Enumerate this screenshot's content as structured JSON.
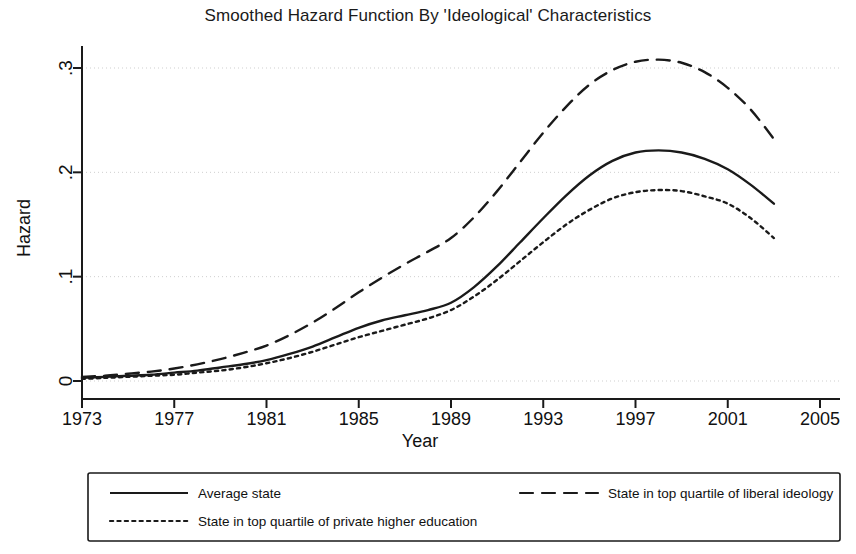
{
  "chart_data": {
    "type": "line",
    "title": "Smoothed Hazard Function By 'Ideological' Characteristics",
    "xlabel": "Year",
    "ylabel": "Hazard",
    "xlim": [
      1973,
      2005
    ],
    "ylim": [
      0,
      0.33
    ],
    "xticks": [
      1973,
      1977,
      1981,
      1985,
      1989,
      1993,
      1997,
      2001,
      2005
    ],
    "xtick_labels": [
      "1973",
      "1977",
      "1981",
      "1985",
      "1989",
      "1993",
      "1997",
      "2001",
      "2005"
    ],
    "yticks": [
      0,
      0.1,
      0.2,
      0.3
    ],
    "ytick_labels": [
      "0",
      ".1",
      ".2",
      ".3"
    ],
    "grid": "horizontal-dotted-light",
    "legend_position": "below-plot",
    "x": [
      1973,
      1974,
      1975,
      1976,
      1977,
      1978,
      1979,
      1980,
      1981,
      1982,
      1983,
      1984,
      1985,
      1986,
      1987,
      1988,
      1989,
      1990,
      1991,
      1992,
      1993,
      1994,
      1995,
      1996,
      1997,
      1998,
      1999,
      2000,
      2001,
      2002,
      2003
    ],
    "series": [
      {
        "name": "Average state",
        "style": "solid",
        "values": [
          0.003,
          0.004,
          0.005,
          0.006,
          0.008,
          0.01,
          0.013,
          0.016,
          0.02,
          0.026,
          0.033,
          0.042,
          0.051,
          0.058,
          0.063,
          0.068,
          0.075,
          0.09,
          0.11,
          0.133,
          0.156,
          0.178,
          0.197,
          0.211,
          0.219,
          0.221,
          0.219,
          0.213,
          0.203,
          0.188,
          0.17
        ]
      },
      {
        "name": "State in top quartile of liberal ideology",
        "style": "dashed",
        "values": [
          0.004,
          0.005,
          0.007,
          0.009,
          0.012,
          0.016,
          0.021,
          0.027,
          0.034,
          0.044,
          0.056,
          0.07,
          0.085,
          0.099,
          0.112,
          0.124,
          0.137,
          0.157,
          0.182,
          0.21,
          0.238,
          0.263,
          0.284,
          0.298,
          0.306,
          0.308,
          0.305,
          0.296,
          0.281,
          0.26,
          0.232
        ]
      },
      {
        "name": "State in top quartile of private higher education",
        "style": "dotted",
        "values": [
          0.002,
          0.003,
          0.004,
          0.005,
          0.006,
          0.008,
          0.01,
          0.013,
          0.017,
          0.022,
          0.028,
          0.035,
          0.042,
          0.048,
          0.054,
          0.06,
          0.068,
          0.081,
          0.097,
          0.115,
          0.133,
          0.15,
          0.164,
          0.175,
          0.181,
          0.183,
          0.182,
          0.177,
          0.17,
          0.156,
          0.137
        ]
      }
    ],
    "annotations": []
  },
  "legend": {
    "entries": [
      {
        "label": "Average state",
        "style": "solid"
      },
      {
        "label": "State in top quartile of liberal ideology",
        "style": "dashed"
      },
      {
        "label": "State in top quartile of private higher education",
        "style": "dotted"
      }
    ]
  },
  "colors": {
    "ink": "#1a1a1a",
    "grid": "#cfcfcf",
    "background": "#ffffff"
  }
}
